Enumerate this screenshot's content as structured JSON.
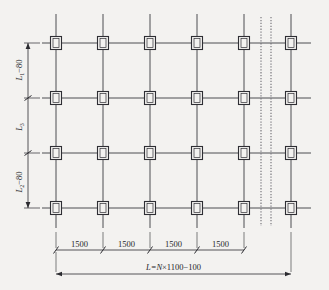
{
  "drawing": {
    "title": "structural-grid-plan",
    "colors": {
      "background": "#f3f2f0",
      "line": "#3a3a40",
      "joint": "#2e2e34",
      "dimension": "#2b2b30",
      "break_line": "#6e6e74"
    },
    "grid": {
      "columns": 6,
      "rows": 4,
      "joint_count": 24
    }
  },
  "vertical_dimensions": [
    {
      "id": "top-segment",
      "label_main": "L",
      "label_sub": "1",
      "label_rest": "−80",
      "text": "L₁−80"
    },
    {
      "id": "middle-segment",
      "label_main": "L",
      "label_sub": "3",
      "label_rest": "",
      "text": "L₃"
    },
    {
      "id": "bottom-segment",
      "label_main": "L",
      "label_sub": "2",
      "label_rest": "−80",
      "text": "L₂−80"
    }
  ],
  "horizontal_dimensions": {
    "segments": [
      "1500",
      "1500",
      "1500",
      "1500"
    ],
    "overall": {
      "prefix": "L=",
      "variable": "N",
      "suffix": "×1100−100",
      "text": "L=N×1100−100"
    }
  },
  "break_lines": {
    "count": 2,
    "style": "dotted-vertical"
  }
}
